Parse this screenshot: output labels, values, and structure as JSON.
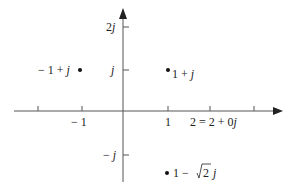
{
  "diagram": {
    "axes": {
      "real_axis": {
        "y": 111,
        "x_start": 14,
        "x_end": 281,
        "color": "#555555"
      },
      "imag_axis": {
        "x": 123,
        "y_start": 182,
        "y_end": 10,
        "color": "#555555"
      }
    },
    "real_ticks": [
      {
        "x": 38,
        "label": ""
      },
      {
        "x": 82,
        "label": "− 1"
      },
      {
        "x": 168,
        "label": "1"
      },
      {
        "x": 210,
        "label": "2 = 2 + 0",
        "suffix": "j"
      },
      {
        "x": 254,
        "label": ""
      }
    ],
    "imag_ticks": [
      {
        "y": 27,
        "label": "2",
        "suffix": "j"
      },
      {
        "y": 70,
        "label": "",
        "suffix": "j"
      },
      {
        "y": 155,
        "label": "− ",
        "suffix": "j"
      }
    ],
    "points": [
      {
        "name": "minus-one-plus-j",
        "x": 80,
        "y": 70,
        "label": "− 1 + ",
        "suffix": "j"
      },
      {
        "name": "one-plus-j",
        "x": 168,
        "y": 70,
        "label": "1 + ",
        "suffix": "j"
      },
      {
        "name": "one-minus-root2-j",
        "x": 167,
        "y": 173,
        "label_prefix": "1 −",
        "sqrt": "2",
        "suffix": "j"
      }
    ]
  }
}
